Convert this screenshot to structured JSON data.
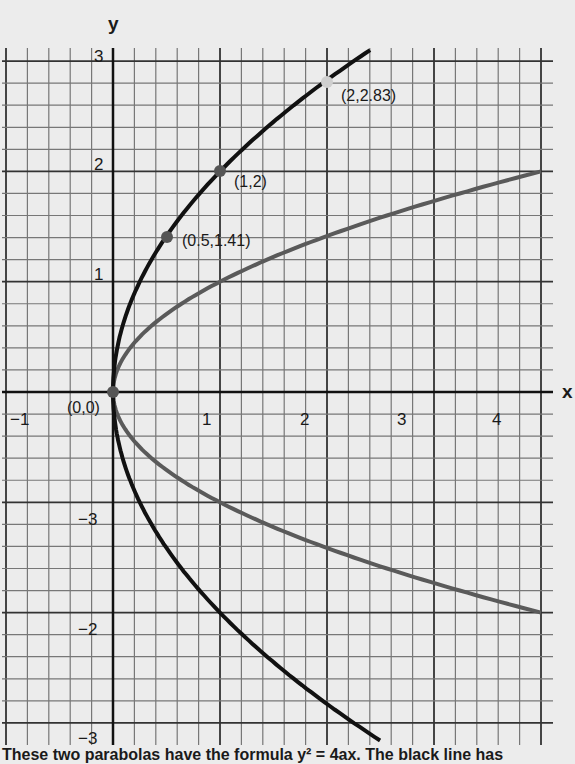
{
  "chart_data": {
    "type": "line",
    "title": "",
    "xlabel": "x",
    "ylabel": "y",
    "xlim": [
      -1,
      4
    ],
    "ylim": [
      -3,
      3
    ],
    "grid": true,
    "x_ticks": [
      "−1",
      "1",
      "2",
      "3",
      "4"
    ],
    "y_ticks_positive": [
      "1",
      "2",
      "3"
    ],
    "y_ticks_negative": [
      "−3",
      "−2",
      "−3"
    ],
    "series": [
      {
        "name": "black parabola (a=1)",
        "formula": "y^2 = 4x",
        "color": "#111111",
        "points": [
          [
            0,
            0
          ],
          [
            0.5,
            1.41
          ],
          [
            1,
            2
          ],
          [
            2,
            2.83
          ],
          [
            2.4,
            3.1
          ],
          [
            0.5,
            -1.41
          ],
          [
            1,
            -2
          ],
          [
            2,
            -2.83
          ],
          [
            2.5,
            -3.16
          ]
        ]
      },
      {
        "name": "grey parabola (a=0.25)",
        "formula": "y^2 = x",
        "color": "#5a5a5a",
        "points": [
          [
            0,
            0
          ],
          [
            1,
            1
          ],
          [
            2,
            1.41
          ],
          [
            4,
            2
          ],
          [
            1,
            -1
          ],
          [
            2,
            -1.41
          ],
          [
            4,
            -2
          ]
        ]
      }
    ],
    "annotations": [
      {
        "label": "(0,0)",
        "x": 0,
        "y": 0
      },
      {
        "label": "(0.5,1.41)",
        "x": 0.5,
        "y": 1.41
      },
      {
        "label": "(1,2)",
        "x": 1,
        "y": 2
      },
      {
        "label": "(2,2.83)",
        "x": 2,
        "y": 2.83
      }
    ]
  },
  "labels": {
    "x_axis": "x",
    "y_axis": "y",
    "origin": "(0,0)",
    "p1": "(0.5,1.41)",
    "p2": "(1,2)",
    "p3": "(2,2.83)"
  },
  "ticks": {
    "xm1": "−1",
    "x1": "1",
    "x2": "2",
    "x3": "3",
    "x4": "4",
    "y1": "1",
    "y2": "2",
    "y3": "3",
    "ym1": "−3",
    "ym2": "−2",
    "ym3": "−3"
  },
  "caption": "These two parabolas have the formula y² = 4ax. The black line has"
}
